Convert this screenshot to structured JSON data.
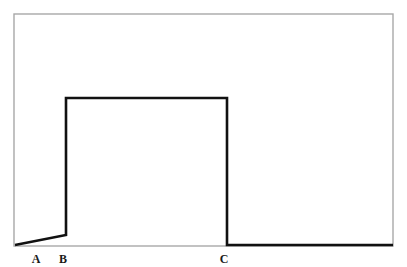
{
  "figure": {
    "title": "",
    "background_color": "#ffffff",
    "frame": {
      "name": "plot-frame",
      "x": 14,
      "y": 14,
      "width": 379,
      "height": 232,
      "stroke_color": "#a8a8a8",
      "stroke_width": 1.4,
      "fill": "none"
    },
    "curve": {
      "name": "step-curve",
      "stroke_color": "#111111",
      "stroke_width": 2.6,
      "fill": "none",
      "points": "15,245 66,235 66,98 227,98 227,245 393,245"
    },
    "labels": [
      {
        "id": "A",
        "text": "A",
        "x": 36,
        "y": 263
      },
      {
        "id": "B",
        "text": "B",
        "x": 63,
        "y": 263
      },
      {
        "id": "C",
        "text": "C",
        "x": 224,
        "y": 263
      }
    ]
  },
  "chart_data": {
    "type": "line",
    "title": "",
    "subtitle": "",
    "xlabel": "",
    "ylabel": "",
    "grid": false,
    "legend": null,
    "legend_position": "none",
    "xlim": [
      0,
      407
    ],
    "ylim": [
      0,
      267
    ],
    "axis_tick_labels": [
      "A",
      "B",
      "C"
    ],
    "annotations": [
      {
        "label": "A",
        "x": 36,
        "note": "start of rising ramp on baseline"
      },
      {
        "label": "B",
        "x": 63,
        "note": "end of ramp; vertical rise to plateau"
      },
      {
        "label": "C",
        "x": 224,
        "note": "end of plateau; vertical drop to baseline"
      }
    ],
    "series": [
      {
        "name": "step-curve",
        "x": [
          15,
          66,
          66,
          227,
          227,
          393
        ],
        "y": [
          245,
          235,
          98,
          98,
          245,
          245
        ],
        "color": "#111111",
        "linewidth": 2.6,
        "description": "Flat-low start with shallow upward ramp to B, sharp vertical rise to a flat high plateau held from B to C, then a sharp vertical drop back to the low baseline which continues to the right edge."
      }
    ]
  }
}
